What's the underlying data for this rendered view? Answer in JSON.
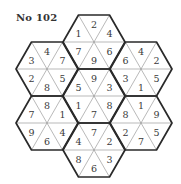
{
  "puzzle": {
    "title": "No 102",
    "type": "hexagon number puzzle",
    "cell_order": [
      "top",
      "upper-right",
      "lower-right",
      "bottom",
      "lower-left",
      "upper-left"
    ],
    "hexagons": [
      {
        "name": "top",
        "cx": 94,
        "cy": 42,
        "values": [
          2,
          4,
          6,
          9,
          7,
          1
        ]
      },
      {
        "name": "upper-left",
        "cx": 47,
        "cy": 69,
        "values": [
          4,
          7,
          5,
          8,
          2,
          3
        ]
      },
      {
        "name": "upper-right",
        "cx": 141,
        "cy": 69,
        "values": [
          4,
          2,
          5,
          1,
          3,
          6
        ]
      },
      {
        "name": "center",
        "cx": 94,
        "cy": 96,
        "values": [
          9,
          3,
          8,
          7,
          1,
          5
        ]
      },
      {
        "name": "lower-left",
        "cx": 47,
        "cy": 123,
        "values": [
          8,
          1,
          4,
          6,
          9,
          7
        ]
      },
      {
        "name": "lower-right",
        "cx": 141,
        "cy": 123,
        "values": [
          1,
          9,
          5,
          7,
          2,
          8
        ]
      },
      {
        "name": "bottom",
        "cx": 94,
        "cy": 150,
        "values": [
          7,
          2,
          3,
          6,
          8,
          4
        ]
      }
    ],
    "hex_side": 31,
    "hex_half_height": 27,
    "colors": {
      "outline": "#2a2a2a",
      "inner_line": "#8a8a8a",
      "text": "#3a3a3a",
      "background": "#ffffff"
    }
  }
}
